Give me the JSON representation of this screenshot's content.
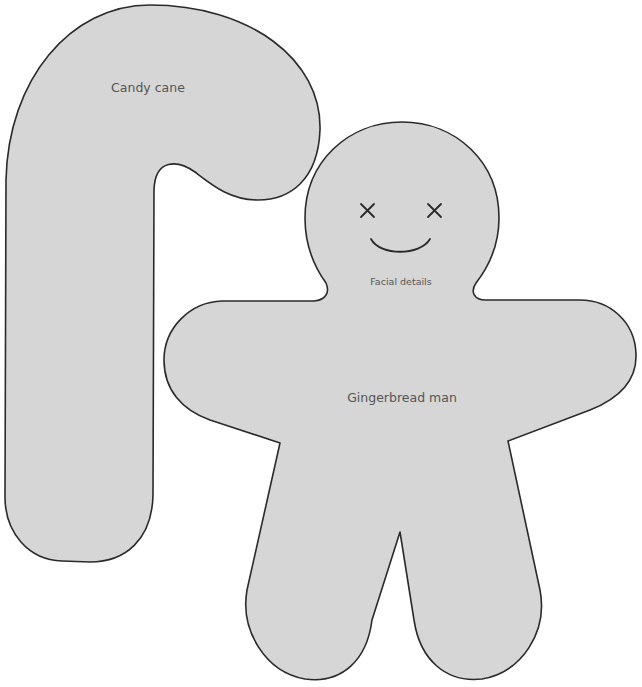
{
  "template": {
    "shapes": [
      {
        "id": "candy-cane",
        "label": "Candy cane"
      },
      {
        "id": "gingerbread-man",
        "label": "Gingerbread man",
        "detail_label": "Facial details"
      }
    ],
    "colors": {
      "fill": "#d6d6d6",
      "outline": "#2a2a2a",
      "label_text": "#555555",
      "background": "#ffffff"
    },
    "face": {
      "eyes": [
        "x-mark",
        "x-mark"
      ],
      "mouth": "smile"
    }
  }
}
